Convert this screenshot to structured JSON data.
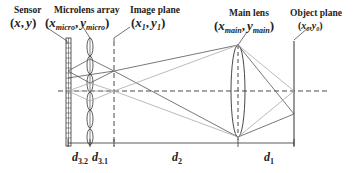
{
  "labels": {
    "sensor": {
      "title": "Sensor",
      "coord_open": "(",
      "x": "x",
      "comma": ",",
      "y": "y",
      "coord_close": ")"
    },
    "microlens": {
      "title": "Microlens array",
      "open": "(",
      "x": "x",
      "x_sub": "micro",
      "comma": ",",
      "y": "y",
      "y_sub": "micro",
      "close": ")"
    },
    "image_plane": {
      "title": "Image plane",
      "open": "(",
      "x": "x",
      "x_sub": "1",
      "comma": ",",
      "y": "y",
      "y_sub": "1",
      "close": ")"
    },
    "main_lens": {
      "title": "Main lens",
      "open": "(",
      "x": "x",
      "x_sub": "main",
      "comma": ",",
      "y": "y",
      "y_sub": "main",
      "close": ")"
    },
    "object_plane": {
      "title": "Object plane",
      "open": "(",
      "x": "x",
      "x_sub": "0",
      "comma": ",",
      "y": "y",
      "y_sub": "0",
      "close": ")"
    }
  },
  "dimensions": [
    {
      "name": "d",
      "sub": "3.2"
    },
    {
      "name": "d",
      "sub": "3.1"
    },
    {
      "name": "d",
      "sub": "2"
    },
    {
      "name": "d",
      "sub": "1"
    }
  ],
  "colors": {
    "dark_ray": "#555555",
    "light_ray": "#aaaaaa",
    "line": "#333333"
  }
}
